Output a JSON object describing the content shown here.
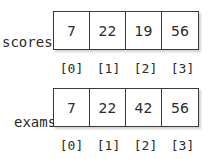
{
  "arrays": [
    {
      "name": "scores",
      "values": [
        "7",
        "22",
        "19",
        "56"
      ],
      "indices": [
        "[0]",
        "[1]",
        "[2]",
        "[3]"
      ]
    },
    {
      "name": "exams",
      "values": [
        "7",
        "22",
        "42",
        "56"
      ],
      "indices": [
        "[0]",
        "[1]",
        "[2]",
        "[3]"
      ]
    }
  ]
}
